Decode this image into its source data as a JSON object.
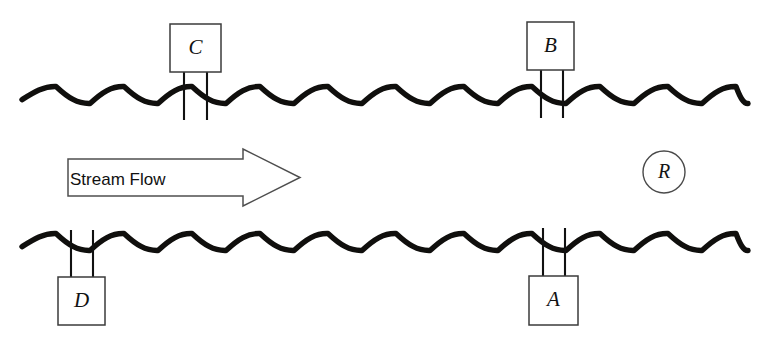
{
  "diagram": {
    "background_color": "#ffffff",
    "wave_color": "#100f0d",
    "outline_color": "#4a4a4a",
    "label_color": "#121212",
    "canvas": {
      "width": 773,
      "height": 348
    },
    "flow_arrow": {
      "label": "Stream Flow",
      "direction": "right",
      "label_x": 70,
      "label_y": 181,
      "shaft_left": 68,
      "shaft_top": 159,
      "shaft_bottom": 196,
      "head_base_x": 243,
      "tip_x": 300,
      "head_top": 149,
      "head_bottom": 206
    },
    "waves": [
      {
        "name": "upper-stream-surface",
        "x_start": 22,
        "x_end": 748,
        "baseline_y": 95,
        "amplitude": 8.5,
        "wavelength": 68
      },
      {
        "name": "lower-stream-surface",
        "x_start": 22,
        "x_end": 748,
        "baseline_y": 242,
        "amplitude": 8.5,
        "wavelength": 68
      }
    ],
    "stations": [
      {
        "id": "station-c",
        "label": "C",
        "position": "above-upper-wave",
        "box_x": 170,
        "box_y": 24,
        "box_w": 51,
        "box_h": 48,
        "wire_left_x": 184,
        "wire_right_x": 207,
        "wire_y_start": 72,
        "wire_y_end": 120
      },
      {
        "id": "station-b",
        "label": "B",
        "position": "above-upper-wave",
        "box_x": 527,
        "box_y": 22,
        "box_w": 47,
        "box_h": 48,
        "wire_left_x": 541,
        "wire_right_x": 563,
        "wire_y_start": 70,
        "wire_y_end": 118
      },
      {
        "id": "station-d",
        "label": "D",
        "position": "below-lower-wave",
        "box_x": 58,
        "box_y": 277,
        "box_w": 47,
        "box_h": 48,
        "wire_left_x": 71,
        "wire_right_x": 93,
        "wire_y_start": 230,
        "wire_y_end": 277
      },
      {
        "id": "station-a",
        "label": "A",
        "position": "below-lower-wave",
        "box_x": 529,
        "box_y": 276,
        "box_w": 49,
        "box_h": 49,
        "wire_left_x": 543,
        "wire_right_x": 565,
        "wire_y_start": 228,
        "wire_y_end": 276
      }
    ],
    "ring_marker": {
      "id": "marker-r",
      "label": "R",
      "center_x": 664,
      "center_y": 172,
      "radius": 21
    }
  }
}
